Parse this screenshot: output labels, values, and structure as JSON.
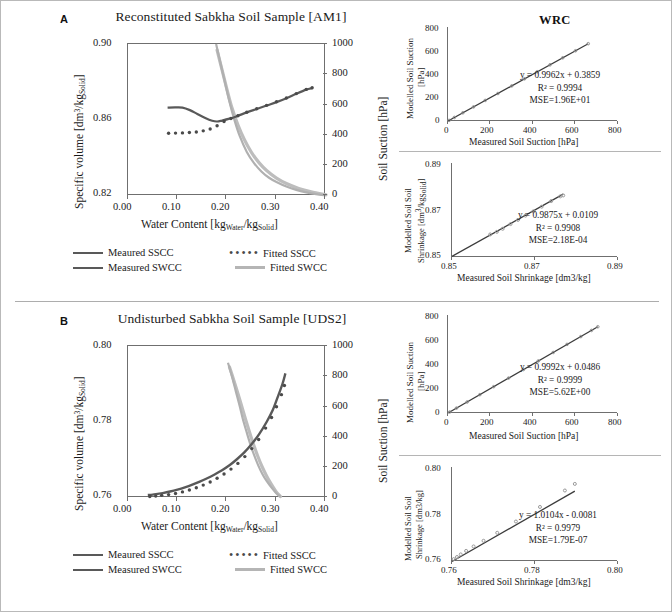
{
  "figure": {
    "panels": [
      {
        "letter": "A",
        "title": "Reconstituted Sabkha Soil Sample [AM1]",
        "legend": [
          {
            "style": "line-dark",
            "label": "Meaured SSCC"
          },
          {
            "style": "dots",
            "label": "Fitted SSCC"
          },
          {
            "style": "line-dark",
            "label": "Measured SWCC"
          },
          {
            "style": "line-light",
            "label": "Fitted SWCC"
          }
        ]
      },
      {
        "letter": "B",
        "title": "Undisturbed Sabkha Soil Sample [UDS2]",
        "legend": [
          {
            "style": "line-dark",
            "label": "Meaured SSCC"
          },
          {
            "style": "dots",
            "label": "Fitted SSCC"
          },
          {
            "style": "line-dark",
            "label": "Measured SWCC"
          },
          {
            "style": "line-light",
            "label": "Fitted SWCC"
          }
        ]
      }
    ]
  },
  "chart_data": [
    {
      "id": "main-a",
      "type": "line",
      "title": "Reconstituted Sabkha Soil Sample [AM1]",
      "xlabel": "Water Content [kgWater/kgSolid]",
      "ylabel": "Specific volume [dm3/kgSolid]",
      "y2label": "Soil Suction [hPa]",
      "xlim": [
        0.0,
        0.4
      ],
      "ylim": [
        0.82,
        0.9
      ],
      "y2lim": [
        0,
        1000
      ],
      "xticks": [
        "0.00",
        "0.10",
        "0.20",
        "0.30",
        "0.40"
      ],
      "yticks": [
        "0.82",
        "0.86",
        "0.90"
      ],
      "y2ticks": [
        "0",
        "200",
        "400",
        "600",
        "800",
        "1000"
      ],
      "grid": false,
      "series": [
        {
          "name": "Measured SSCC",
          "axis": "left",
          "x": [
            0.08,
            0.095,
            0.11,
            0.125,
            0.14,
            0.155,
            0.17,
            0.18,
            0.19,
            0.205,
            0.22,
            0.24,
            0.26,
            0.28,
            0.3,
            0.32,
            0.34,
            0.36,
            0.372
          ],
          "y": [
            0.8665,
            0.8666,
            0.8665,
            0.8652,
            0.8632,
            0.8612,
            0.8596,
            0.8592,
            0.8597,
            0.8607,
            0.862,
            0.864,
            0.8658,
            0.8676,
            0.8694,
            0.8714,
            0.8738,
            0.876,
            0.8768
          ]
        },
        {
          "name": "Fitted SSCC",
          "axis": "left",
          "x": [
            0.082,
            0.096,
            0.11,
            0.124,
            0.138,
            0.152,
            0.166,
            0.18,
            0.194,
            0.208,
            0.222,
            0.24,
            0.26,
            0.28,
            0.3,
            0.32,
            0.34,
            0.36,
            0.372
          ],
          "y": [
            0.853,
            0.8531,
            0.8532,
            0.8534,
            0.8537,
            0.8543,
            0.8553,
            0.857,
            0.8592,
            0.8608,
            0.8622,
            0.8641,
            0.8659,
            0.8677,
            0.8696,
            0.8716,
            0.8739,
            0.8761,
            0.877
          ]
        },
        {
          "name": "Measured SWCC",
          "axis": "right",
          "x": [
            0.178,
            0.185,
            0.195,
            0.205,
            0.215,
            0.225,
            0.24,
            0.255,
            0.27,
            0.285,
            0.3,
            0.32,
            0.34,
            0.36,
            0.38,
            0.4
          ],
          "y": [
            1000,
            900,
            760,
            620,
            500,
            400,
            290,
            215,
            160,
            120,
            92,
            62,
            40,
            24,
            12,
            5
          ]
        },
        {
          "name": "Fitted SWCC",
          "axis": "right",
          "x": [
            0.18,
            0.19,
            0.2,
            0.21,
            0.222,
            0.235,
            0.25,
            0.265,
            0.28,
            0.3,
            0.32,
            0.345,
            0.37,
            0.4
          ],
          "y": [
            960,
            830,
            700,
            580,
            468,
            372,
            284,
            218,
            168,
            118,
            82,
            50,
            28,
            8
          ]
        }
      ]
    },
    {
      "id": "wrc-a",
      "type": "scatter",
      "title": "WRC",
      "xlabel": "Measured Soil Suction [hPa]",
      "ylabel": "Modelled Soil Suction [hPa]",
      "xlim": [
        0,
        800
      ],
      "ylim": [
        0,
        800
      ],
      "xticks": [
        "0",
        "200",
        "400",
        "600",
        "800"
      ],
      "yticks": [
        "0",
        "200",
        "400",
        "600",
        "800"
      ],
      "grid": false,
      "annotations": [
        "y = 0.9962x + 0.3859",
        "R² = 0.9994",
        "MSE=1.96E+01"
      ],
      "fit": {
        "slope": 0.9962,
        "intercept": 0.3859,
        "r2": 0.9994,
        "mse": "1.96E+01"
      },
      "points_x": [
        5,
        30,
        70,
        120,
        175,
        235,
        300,
        360,
        420,
        480,
        540,
        600,
        660
      ],
      "points_y": [
        5,
        30,
        70,
        120,
        175,
        234,
        299,
        359,
        419,
        478,
        538,
        598,
        658
      ]
    },
    {
      "id": "ssc-a",
      "type": "scatter",
      "title": "SSC",
      "xlabel": "Measured Soil Shrinkage [dm3/kg]",
      "ylabel": "Modelled Soil Shrinkage [dm3/kgSolid]",
      "xlim": [
        0.85,
        0.89
      ],
      "ylim": [
        0.85,
        0.89
      ],
      "xticks": [
        "0.85",
        "0.87",
        "0.89"
      ],
      "yticks": [
        "0.85",
        "0.87",
        "0.89"
      ],
      "grid": false,
      "annotations": [
        "y = 0.9875x + 0.0109",
        "R² = 0.9908",
        "MSE=2.18E-04"
      ],
      "fit": {
        "slope": 0.9875,
        "intercept": 0.0109,
        "r2": 0.9908,
        "mse": "2.18E-04"
      },
      "points_x": [
        0.8592,
        0.8608,
        0.8622,
        0.8641,
        0.8659,
        0.8677,
        0.8696,
        0.8716,
        0.8739,
        0.8761,
        0.8768
      ],
      "points_y": [
        0.8596,
        0.8607,
        0.862,
        0.864,
        0.8658,
        0.8676,
        0.8694,
        0.8714,
        0.8738,
        0.8758,
        0.8762
      ]
    },
    {
      "id": "main-b",
      "type": "line",
      "title": "Undisturbed Sabkha Soil Sample [UDS2]",
      "xlabel": "Water Content [kgWater/kgSolid]",
      "ylabel": "Specific volume [dm3/kgSolid]",
      "y2label": "Soil Suction [hPa]",
      "xlim": [
        0.0,
        0.4
      ],
      "ylim": [
        0.76,
        0.8
      ],
      "y2lim": [
        0,
        1000
      ],
      "xticks": [
        "0.00",
        "0.10",
        "0.20",
        "0.30",
        "0.40"
      ],
      "yticks": [
        "0.76",
        "0.78",
        "0.80"
      ],
      "y2ticks": [
        "0",
        "200",
        "400",
        "600",
        "800",
        "1000"
      ],
      "grid": false,
      "series": [
        {
          "name": "Measured SSCC",
          "axis": "left",
          "x": [
            0.04,
            0.05,
            0.06,
            0.07,
            0.085,
            0.1,
            0.115,
            0.13,
            0.145,
            0.16,
            0.175,
            0.19,
            0.205,
            0.22,
            0.235,
            0.25,
            0.265,
            0.28,
            0.292,
            0.302,
            0.312,
            0.318
          ],
          "y": [
            0.7608,
            0.7609,
            0.7611,
            0.7613,
            0.7617,
            0.7622,
            0.7628,
            0.7635,
            0.7643,
            0.7652,
            0.7662,
            0.7673,
            0.7686,
            0.7702,
            0.772,
            0.7742,
            0.7768,
            0.78,
            0.783,
            0.7864,
            0.79,
            0.7928
          ]
        },
        {
          "name": "Fitted SSCC",
          "axis": "left",
          "x": [
            0.044,
            0.056,
            0.068,
            0.082,
            0.096,
            0.11,
            0.124,
            0.138,
            0.152,
            0.166,
            0.18,
            0.194,
            0.208,
            0.222,
            0.236,
            0.25,
            0.264,
            0.278,
            0.29,
            0.3,
            0.31,
            0.316
          ],
          "y": [
            0.7604,
            0.7605,
            0.7607,
            0.7609,
            0.7612,
            0.7616,
            0.7621,
            0.7627,
            0.7634,
            0.7642,
            0.7652,
            0.7663,
            0.7676,
            0.7691,
            0.7709,
            0.773,
            0.7754,
            0.7784,
            0.7812,
            0.784,
            0.7872,
            0.7896
          ]
        },
        {
          "name": "Measured SWCC",
          "axis": "right",
          "x": [
            0.202,
            0.21,
            0.218,
            0.226,
            0.232,
            0.24,
            0.248,
            0.256,
            0.264,
            0.272,
            0.28,
            0.29,
            0.3,
            0.308
          ],
          "y": [
            890,
            800,
            700,
            600,
            520,
            430,
            345,
            272,
            208,
            155,
            112,
            68,
            30,
            8
          ]
        },
        {
          "name": "Fitted SWCC",
          "axis": "right",
          "x": [
            0.205,
            0.214,
            0.222,
            0.23,
            0.238,
            0.246,
            0.254,
            0.262,
            0.27,
            0.28,
            0.29,
            0.3,
            0.308
          ],
          "y": [
            862,
            772,
            688,
            600,
            512,
            428,
            348,
            276,
            212,
            145,
            88,
            38,
            10
          ]
        }
      ]
    },
    {
      "id": "wrc-b",
      "type": "scatter",
      "title": "WRC",
      "xlabel": "Measured Soil Suction [hPa]",
      "ylabel": "Modelled Soil Suction [hPa]",
      "xlim": [
        0,
        800
      ],
      "ylim": [
        0,
        800
      ],
      "xticks": [
        "0",
        "200",
        "400",
        "600",
        "800"
      ],
      "yticks": [
        "0",
        "200",
        "400",
        "600",
        "800"
      ],
      "grid": false,
      "annotations": [
        "y = 0.9992x + 0.0486",
        "R² = 0.9999",
        "MSE=5.62E+00"
      ],
      "fit": {
        "slope": 0.9992,
        "intercept": 0.0486,
        "r2": 0.9999,
        "mse": "5.62E+00"
      },
      "points_x": [
        8,
        40,
        90,
        150,
        215,
        285,
        355,
        425,
        495,
        560,
        625,
        675,
        705
      ],
      "points_y": [
        8,
        40,
        90,
        150,
        215,
        285,
        355,
        425,
        494,
        560,
        624,
        674,
        704
      ]
    },
    {
      "id": "ssc-b",
      "type": "scatter",
      "title": "SSC",
      "xlabel": "Measured Soil Shrinkage [dm3/kg]",
      "ylabel": "Modelled Soil Shrinkage [dm3/kg]",
      "xlim": [
        0.76,
        0.8
      ],
      "ylim": [
        0.76,
        0.8
      ],
      "xticks": [
        "0.76",
        "0.78",
        "0.80"
      ],
      "yticks": [
        "0.76",
        "0.78",
        "0.80"
      ],
      "grid": false,
      "annotations": [
        "y = 1.0104x - 0.0081",
        "R² = 0.9979",
        "MSE=1.79E-07"
      ],
      "fit": {
        "slope": 1.0104,
        "intercept": -0.0081,
        "r2": 0.9979,
        "mse": "1.79E-07"
      },
      "points_x": [
        0.7604,
        0.7612,
        0.7621,
        0.7634,
        0.7652,
        0.7676,
        0.7709,
        0.7754,
        0.7812,
        0.7872,
        0.7896
      ],
      "points_y": [
        0.7608,
        0.7617,
        0.7628,
        0.7643,
        0.7662,
        0.7686,
        0.772,
        0.7768,
        0.783,
        0.79,
        0.7928
      ]
    }
  ],
  "labels": {
    "main_a": {
      "xlabel_pre": "Water Content [kg",
      "xlabel_sub1": "Water",
      "xlabel_mid": "/kg",
      "xlabel_sub2": "Solid",
      "xlabel_post": "]",
      "ylabel_pre": "Specific volume [dm",
      "ylabel_sup": "3",
      "ylabel_mid": "/kg",
      "ylabel_sub": "Solid",
      "ylabel_post": "]",
      "y2label": "Soil Suction [hPa]"
    },
    "ssc_a": {
      "ylabel_l1": "Modelled Soil Soil",
      "ylabel_l2_pre": "Shrinkage [dm",
      "ylabel_l2_sup": "3",
      "ylabel_l2_mid": "/kg",
      "ylabel_l2_sub": "Solid",
      "ylabel_l2_post": "]",
      "xlabel": "Measured Soil Shrinkage [dm3/kg]"
    },
    "ssc_b": {
      "ylabel_l1": "Modelled Soil Soil",
      "ylabel_l2": "Shrinkage [dm3/kg]",
      "xlabel": "Measured Soil Shrinkage [dm3/kg]"
    },
    "wrc": {
      "ylabel_l1": "Modelled Soil Suction",
      "ylabel_l2": "[hPa]",
      "xlabel": "Measured Soil Suction [hPa]"
    }
  },
  "colors": {
    "dark_line": "#595959",
    "light_line": "#bdbdbd",
    "dot": "#4a4a4a",
    "axis": "#6f6f6f",
    "text": "#1a1a1a"
  }
}
